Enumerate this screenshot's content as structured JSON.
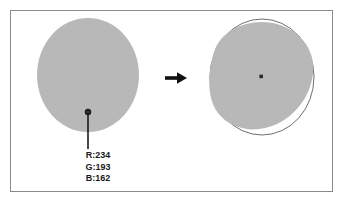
{
  "figure": {
    "background_color": "#ffffff",
    "border_color": "#8a8a8a",
    "shape_fill_color": "#b8b8b8",
    "outline_color": "#6e6e6e",
    "marker_color": "#1a1a1a",
    "arrow_color": "#111111"
  },
  "left_panel": {
    "shape_name": "source-circle",
    "marker_label": "sample-point-marker"
  },
  "transition": {
    "arrow_label": "transforms-to-arrow",
    "icon": "arrow-right-icon"
  },
  "right_panel": {
    "shape_name": "deformed-blob",
    "reference_name": "reference-circle-outline",
    "marker_label": "center-point-marker"
  },
  "readout": {
    "name": "rgb-color-readout",
    "lines": [
      "R:234",
      "G:193",
      "B:162"
    ],
    "red": "R:234",
    "green": "G:193",
    "blue": "B:162",
    "red_value": 234,
    "green_value": 193,
    "blue_value": 162
  }
}
